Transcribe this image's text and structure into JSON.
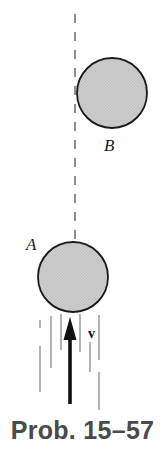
{
  "figure": {
    "caption": "Prob. 15–57",
    "caption_color": "#4a4a4a",
    "background_color": "#ffffff",
    "labels": {
      "ball_a": "A",
      "ball_b": "B",
      "velocity": "v"
    },
    "elements": {
      "ball_a": {
        "name": "A",
        "center_x": 73,
        "center_y": 277,
        "radius": 35,
        "fill": "#c9c9c9",
        "stroke": "#1a1a1a"
      },
      "ball_b": {
        "name": "B",
        "center_x": 112,
        "center_y": 93,
        "radius": 35,
        "fill": "#c9c9c9",
        "stroke": "#1a1a1a"
      },
      "center_line": {
        "name": "dashed-vertical-axis",
        "x": 75,
        "y_top": 14,
        "y_bottom": 246,
        "color": "#8e8e8e",
        "dash": "9 9"
      },
      "velocity_arrow": {
        "name": "upward-velocity-arrow",
        "x": 70,
        "y_tail": 404,
        "y_tip": 318,
        "color": "#111111",
        "shaft_width": 3.6
      },
      "flow_lines": {
        "name": "fluid-streamlines",
        "color": "#9a9a9a",
        "lines": [
          {
            "x": 40,
            "y1": 320,
            "y2": 328
          },
          {
            "x": 40,
            "y1": 346,
            "y2": 392
          },
          {
            "x": 51,
            "y1": 316,
            "y2": 368
          },
          {
            "x": 61,
            "y1": 314,
            "y2": 350
          },
          {
            "x": 80,
            "y1": 314,
            "y2": 352
          },
          {
            "x": 90,
            "y1": 342,
            "y2": 372
          },
          {
            "x": 99,
            "y1": 315,
            "y2": 360
          },
          {
            "x": 99,
            "y1": 372,
            "y2": 410
          }
        ]
      }
    }
  }
}
